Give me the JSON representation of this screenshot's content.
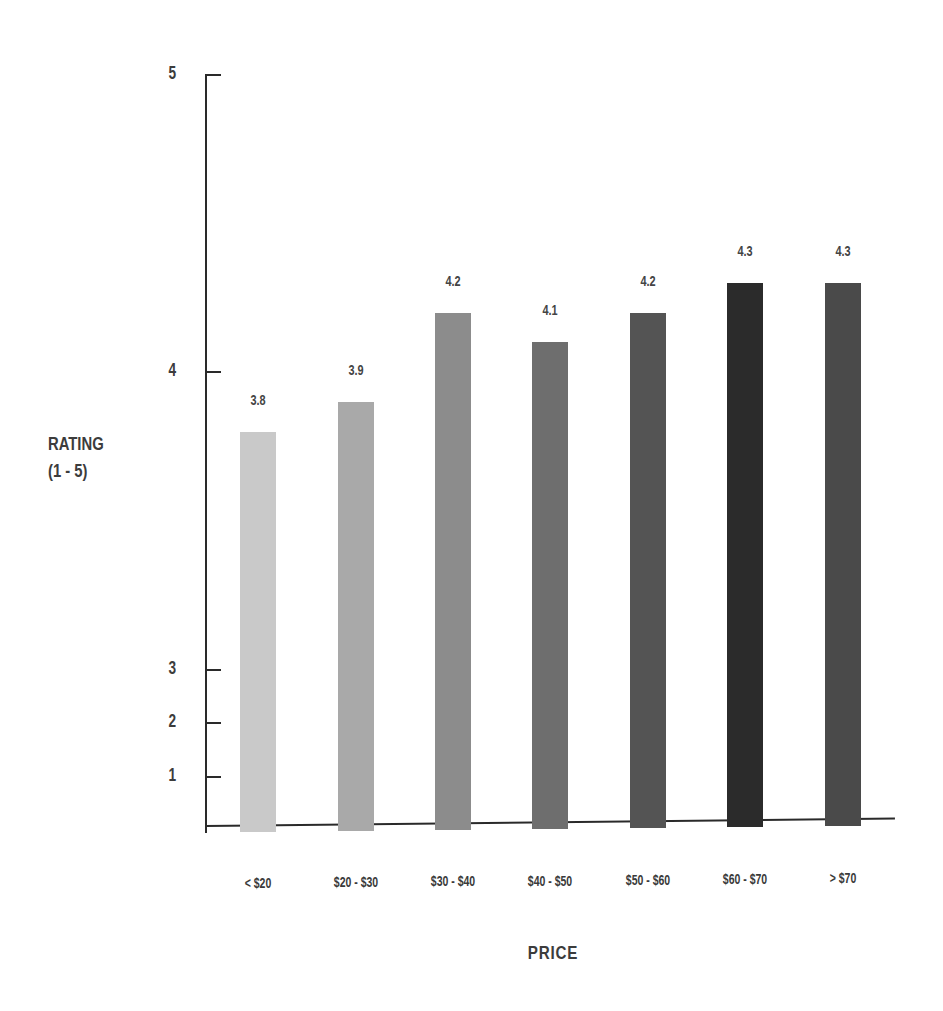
{
  "chart_data": {
    "type": "bar",
    "title": "",
    "xlabel": "PRICE",
    "ylabel": "RATING (1 - 5)",
    "ylabel_lines": [
      "RATING",
      "(1 - 5)"
    ],
    "categories": [
      "< $20",
      "$20 - $30",
      "$30 - $40",
      "$40 - $50",
      "$50 - $60",
      "$60 - $70",
      "> $70"
    ],
    "values": [
      3.8,
      3.9,
      4.2,
      4.1,
      4.2,
      4.3,
      4.3
    ],
    "value_labels": [
      "3.8",
      "3.9",
      "4.2",
      "4.1",
      "4.2",
      "4.3",
      "4.3"
    ],
    "bar_colors": [
      "#c9c9c9",
      "#a9a9a9",
      "#8c8c8c",
      "#6e6e6e",
      "#545454",
      "#2b2b2b",
      "#4a4a4a"
    ],
    "yticks": [
      1,
      2,
      3,
      4,
      5
    ],
    "ytick_labels": [
      "1",
      "2",
      "3",
      "4",
      "5"
    ],
    "ylim": [
      0,
      5
    ],
    "grid": false,
    "legend": null,
    "note": "Y axis is non-linear (broken scale): 1-3 compressed, 3-5 expanded"
  }
}
